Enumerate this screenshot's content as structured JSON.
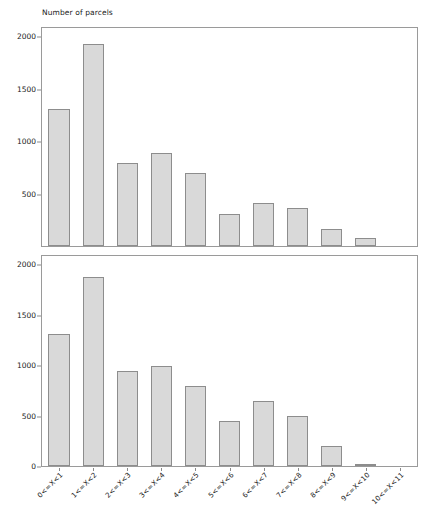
{
  "chart_data": [
    {
      "type": "bar",
      "panel": "top",
      "title": "Number of parcels",
      "xlabel": "",
      "ylabel": "",
      "categories": [
        "0<=X<1",
        "1<=X<2",
        "2<=X<3",
        "3<=X<4",
        "4<=X<5",
        "5<=X<6",
        "6<=X<7",
        "7<=X<8",
        "8<=X<9",
        "9<=X<10",
        "10<=X<11"
      ],
      "values": [
        1320,
        1945,
        800,
        900,
        700,
        310,
        410,
        365,
        160,
        75,
        0
      ],
      "yticks": [
        "2000",
        "1500",
        "1000",
        "500"
      ],
      "ytick_values": [
        2000,
        1500,
        1000,
        500
      ],
      "ylim": [
        0,
        2100
      ],
      "grid": false,
      "legend": "none",
      "xticklabels_shown": false
    },
    {
      "type": "bar",
      "panel": "bottom",
      "title": "",
      "xlabel": "",
      "ylabel": "",
      "categories": [
        "0<=X<1",
        "1<=X<2",
        "2<=X<3",
        "3<=X<4",
        "4<=X<5",
        "5<=X<6",
        "6<=X<7",
        "7<=X<8",
        "8<=X<9",
        "9<=X<10",
        "10<=X<11"
      ],
      "values": [
        1320,
        1895,
        950,
        1000,
        800,
        450,
        650,
        500,
        205,
        25,
        0
      ],
      "yticks": [
        "2000",
        "1500",
        "1000",
        "500",
        "0"
      ],
      "ytick_values": [
        2000,
        1500,
        1000,
        500,
        0
      ],
      "ylim": [
        0,
        2100
      ],
      "grid": false,
      "legend": "none",
      "xticklabels_shown": true
    }
  ],
  "colors": {
    "bar_fill": "#d9d9d9",
    "bar_border": "#8d8d8d",
    "axis": "#8a8a8a",
    "text": "#1a1a1a",
    "background": "#ffffff"
  },
  "top": {
    "title": "Number of parcels"
  }
}
